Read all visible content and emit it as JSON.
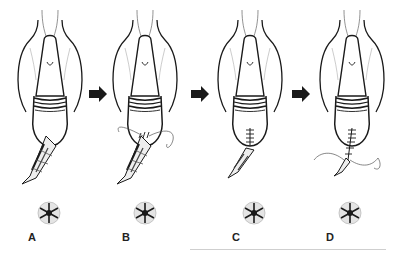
{
  "diagram": {
    "steps": [
      {
        "label": "A",
        "stage": "open wound with excised tissue"
      },
      {
        "label": "B",
        "stage": "initial suture placement"
      },
      {
        "label": "C",
        "stage": "partial closure with sutures"
      },
      {
        "label": "D",
        "stage": "near-complete closure with running suture"
      }
    ],
    "arrows": [
      "step-arrow",
      "step-arrow",
      "step-arrow"
    ],
    "colors": {
      "ink": "#1a1a1a",
      "shade": "#9a9a9a",
      "background": "#ffffff",
      "rule": "#cfcfcf"
    }
  }
}
